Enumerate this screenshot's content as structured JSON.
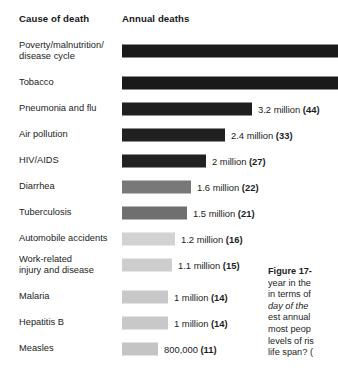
{
  "headers": {
    "cause": "Cause of death",
    "deaths": "Annual deaths"
  },
  "chart_data": {
    "type": "bar",
    "title": "Annual deaths",
    "xlabel": "Annual deaths",
    "ylabel": "Cause of death",
    "orientation": "horizontal",
    "grid": false,
    "legend": false,
    "units": "deaths per year",
    "note": "Number in parentheses is deaths per minute; top two bars are clipped by the image edge",
    "categories": [
      "Poverty/malnutrition/\ndisease cycle",
      "Tobacco",
      "Pneumonia and flu",
      "Air pollution",
      "HIV/AIDS",
      "Diarrhea",
      "Tuberculosis",
      "Automobile accidents",
      "Work-related\ninjury and disease",
      "Malaria",
      "Hepatitis B",
      "Measles"
    ],
    "values": [
      null,
      null,
      3200000,
      2400000,
      2000000,
      1600000,
      1500000,
      1200000,
      1100000,
      1000000,
      1000000,
      800000
    ],
    "value_labels": [
      "",
      "",
      "3.2 million",
      "2.4 million",
      "2 million",
      "1.6 million",
      "1.5 million",
      "1.2 million",
      "1.1 million",
      "1 million",
      "1 million",
      "800,000"
    ],
    "per_minute": [
      null,
      null,
      44,
      33,
      27,
      22,
      21,
      16,
      15,
      14,
      14,
      11
    ],
    "per_minute_labels": [
      "",
      "",
      "(44)",
      "(33)",
      "(27)",
      "(22)",
      "(21)",
      "(16)",
      "(15)",
      "(14)",
      "(14)",
      "(11)"
    ],
    "bar_colors": [
      "#1a1a1a",
      "#1a1a1a",
      "#1f1f1f",
      "#202020",
      "#212121",
      "#787878",
      "#6f6f6f",
      "#d2d2d2",
      "#cdcdcd",
      "#c8c8c8",
      "#c8c8c8",
      "#c4c4c4"
    ],
    "bar_end_px": [
      338,
      338,
      252,
      225,
      206,
      191,
      187,
      175,
      172,
      168,
      168,
      158
    ],
    "bar_start_px": 122
  },
  "rows": [
    {
      "label": "Poverty/malnutrition/\ndisease cycle",
      "value": "",
      "per_minute": "",
      "color": "#1a1a1a",
      "end": 338,
      "clipped": true
    },
    {
      "label": "Tobacco",
      "value": "",
      "per_minute": "",
      "color": "#1a1a1a",
      "end": 338,
      "clipped": true
    },
    {
      "label": "Pneumonia and flu",
      "value": "3.2 million",
      "per_minute": "(44)",
      "color": "#1f1f1f",
      "end": 252,
      "clipped": false
    },
    {
      "label": "Air pollution",
      "value": "2.4 million",
      "per_minute": "(33)",
      "color": "#202020",
      "end": 225,
      "clipped": false
    },
    {
      "label": "HIV/AIDS",
      "value": "2 million",
      "per_minute": "(27)",
      "color": "#212121",
      "end": 206,
      "clipped": false
    },
    {
      "label": "Diarrhea",
      "value": "1.6 million",
      "per_minute": "(22)",
      "color": "#787878",
      "end": 191,
      "clipped": false
    },
    {
      "label": "Tuberculosis",
      "value": "1.5 million",
      "per_minute": "(21)",
      "color": "#6f6f6f",
      "end": 187,
      "clipped": false
    },
    {
      "label": "Automobile accidents",
      "value": "1.2 million",
      "per_minute": "(16)",
      "color": "#d2d2d2",
      "end": 175,
      "clipped": false
    },
    {
      "label": "Work-related\ninjury and disease",
      "value": "1.1 million",
      "per_minute": "(15)",
      "color": "#cdcdcd",
      "end": 172,
      "clipped": false
    },
    {
      "label": "Malaria",
      "value": "1 million",
      "per_minute": "(14)",
      "color": "#c8c8c8",
      "end": 168,
      "clipped": false
    },
    {
      "label": "Hepatitis B",
      "value": "1 million",
      "per_minute": "(14)",
      "color": "#c8c8c8",
      "end": 168,
      "clipped": false
    },
    {
      "label": "Measles",
      "value": "800,000",
      "per_minute": "(11)",
      "color": "#c4c4c4",
      "end": 158,
      "clipped": false
    }
  ],
  "caption": {
    "lines": [
      {
        "text": "Figure 17-",
        "style": "bold"
      },
      {
        "text": "year in the",
        "style": "normal"
      },
      {
        "text": "in terms of",
        "style": "normal"
      },
      {
        "text": "day of the ",
        "style": "italic"
      },
      {
        "text": "est annual",
        "style": "normal"
      },
      {
        "text": "most peop",
        "style": "normal"
      },
      {
        "text": "levels of ris",
        "style": "normal"
      },
      {
        "text": "life span? (",
        "style": "normal"
      }
    ]
  }
}
